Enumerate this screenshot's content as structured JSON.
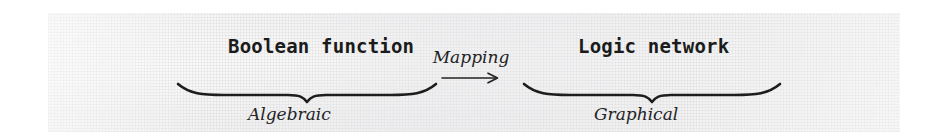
{
  "figure": {
    "left_block": {
      "title": "Boolean function",
      "caption": "Algebraic"
    },
    "right_block": {
      "title": "Logic network",
      "caption": "Graphical"
    },
    "relation": {
      "label": "Mapping",
      "arrow_glyph": "right-arrow"
    },
    "colors": {
      "ink": "#1b1b1b",
      "paper": "#f2f2f3",
      "page": "#ffffff"
    },
    "icons": {
      "left_underbrace": "underbrace",
      "right_underbrace": "underbrace",
      "mapping_arrow": "long-right-arrow"
    }
  }
}
